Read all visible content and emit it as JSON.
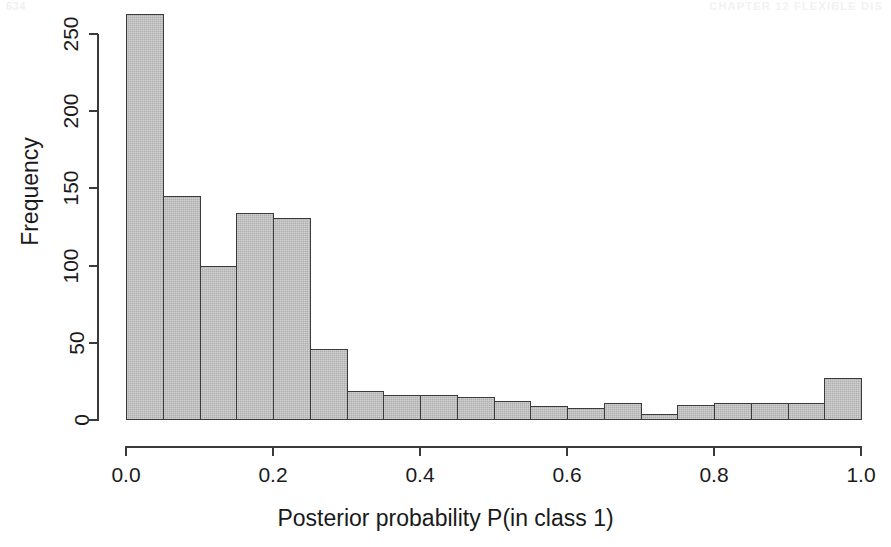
{
  "page": {
    "header_left": "634",
    "header_right": "CHAPTER 12  FLEXIBLE DIS"
  },
  "chart_data": {
    "type": "bar",
    "title": "",
    "subtitle": "",
    "xlabel": "Posterior probability P(in class 1)",
    "ylabel": "Frequency",
    "xlim": [
      0.0,
      1.0
    ],
    "ylim": [
      0,
      250
    ],
    "grid": false,
    "legend": null,
    "bin_width": 0.05,
    "bin_starts": [
      0.0,
      0.05,
      0.1,
      0.15,
      0.2,
      0.25,
      0.3,
      0.35,
      0.4,
      0.45,
      0.5,
      0.55,
      0.6,
      0.65,
      0.7,
      0.75,
      0.8,
      0.85,
      0.9,
      0.95
    ],
    "categories": [
      "0.00-0.05",
      "0.05-0.10",
      "0.10-0.15",
      "0.15-0.20",
      "0.20-0.25",
      "0.25-0.30",
      "0.30-0.35",
      "0.35-0.40",
      "0.40-0.45",
      "0.45-0.50",
      "0.50-0.55",
      "0.55-0.60",
      "0.60-0.65",
      "0.65-0.70",
      "0.70-0.75",
      "0.75-0.80",
      "0.80-0.85",
      "0.85-0.90",
      "0.90-0.95",
      "0.95-1.00"
    ],
    "values": [
      263,
      145,
      100,
      134,
      131,
      46,
      19,
      16,
      16,
      15,
      12,
      9,
      8,
      11,
      4,
      10,
      11,
      11,
      11,
      27
    ],
    "xticks": [
      0.0,
      0.2,
      0.4,
      0.6,
      0.8,
      1.0
    ],
    "xtick_labels": [
      "0.0",
      "0.2",
      "0.4",
      "0.6",
      "0.8",
      "1.0"
    ],
    "yticks": [
      0,
      50,
      100,
      150,
      200,
      250
    ],
    "ytick_labels": [
      "0",
      "50",
      "100",
      "150",
      "200",
      "250"
    ],
    "bar_fill_color": "#b0b0b0",
    "bar_border_color": "#3a3a3a",
    "axis_color": "#3a3a3a",
    "background_color": "#ffffff"
  }
}
